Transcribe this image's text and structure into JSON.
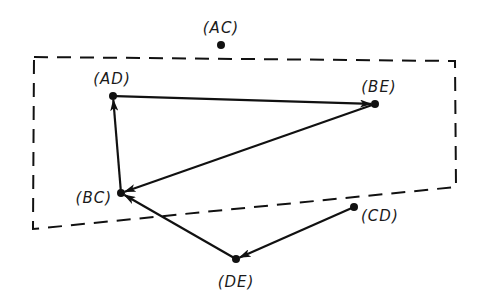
{
  "diagram": {
    "type": "directed-graph",
    "colors": {
      "background": "#ffffff",
      "ink": "#111111"
    },
    "region": {
      "style": "dashed",
      "points": [
        [
          34,
          57
        ],
        [
          455,
          61
        ],
        [
          456,
          187
        ],
        [
          33,
          229
        ]
      ]
    },
    "nodes": [
      {
        "id": "AC",
        "label": "(AC)",
        "x": 221,
        "y": 45,
        "lx": 221,
        "ly": 33,
        "anchor": "middle"
      },
      {
        "id": "AD",
        "label": "(AD)",
        "x": 113,
        "y": 96,
        "lx": 112,
        "ly": 84,
        "anchor": "middle"
      },
      {
        "id": "BE",
        "label": "(BE)",
        "x": 375,
        "y": 104,
        "lx": 379,
        "ly": 92,
        "anchor": "middle"
      },
      {
        "id": "BC",
        "label": "(BC)",
        "x": 121,
        "y": 193,
        "lx": 112,
        "ly": 203,
        "anchor": "end"
      },
      {
        "id": "CD",
        "label": "(CD)",
        "x": 354,
        "y": 207,
        "lx": 361,
        "ly": 221,
        "anchor": "start"
      },
      {
        "id": "DE",
        "label": "(DE)",
        "x": 236,
        "y": 259,
        "lx": 236,
        "ly": 287,
        "anchor": "middle"
      }
    ],
    "edges": [
      {
        "from": "AD",
        "to": "BE"
      },
      {
        "from": "BE",
        "to": "BC"
      },
      {
        "from": "BC",
        "to": "AD"
      },
      {
        "from": "DE",
        "to": "BC"
      },
      {
        "from": "CD",
        "to": "DE"
      }
    ]
  }
}
